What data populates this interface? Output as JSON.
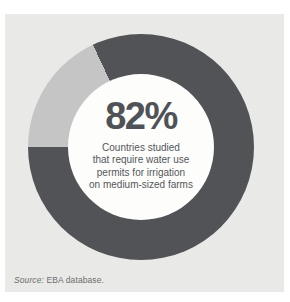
{
  "chart_data": {
    "type": "pie",
    "subtype": "donut",
    "rotation": 270,
    "segments": [
      {
        "name": "remainder",
        "value": 18,
        "color": "#c4c5c4"
      },
      {
        "name": "countries-requiring-permits",
        "value": 82,
        "color": "#515356"
      }
    ],
    "center_label": "82%",
    "center_text": "Countries studied that require water use permits for irrigation on medium-sized farms",
    "legend": "none",
    "source_note": "Source: EBA database."
  },
  "center": {
    "percent": "82%",
    "description_lines": [
      "Countries studied",
      "that require water use",
      "permits for irrigation",
      "on medium-sized farms"
    ]
  },
  "source": {
    "label_italic": "Source:",
    "label_rest": " EBA database."
  },
  "colors": {
    "panel_background": "#e9e9e7",
    "donut_main": "#515356",
    "donut_remainder": "#c4c5c4",
    "center_circle": "#fdfdfc",
    "percent_text": "#4f5256",
    "description_text": "#55575a",
    "source_text": "#6e6e6e"
  }
}
